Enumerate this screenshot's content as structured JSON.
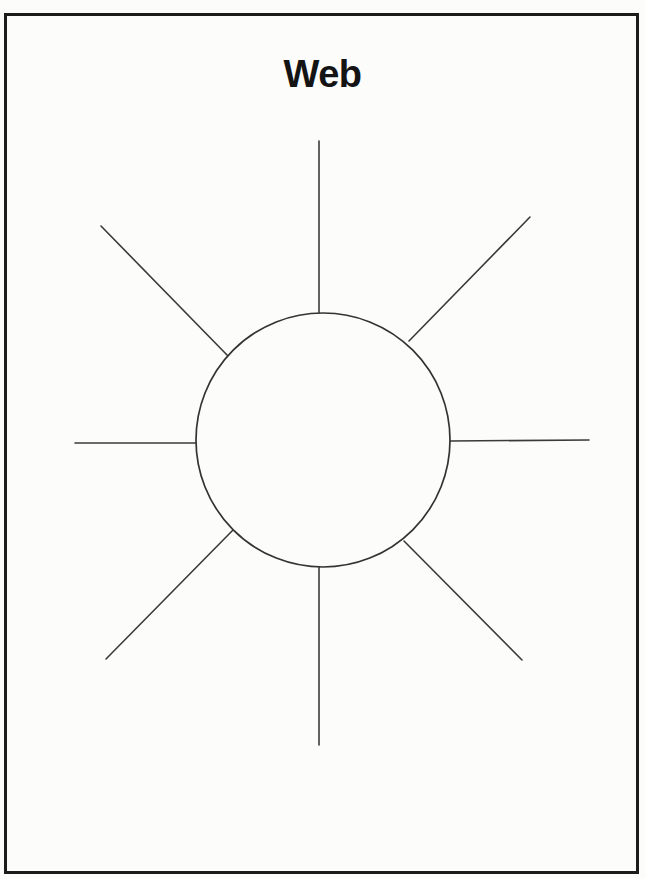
{
  "page": {
    "title": "Web",
    "background_color": "#fcfcfa",
    "border_color": "#1c1c1c"
  },
  "diagram": {
    "type": "web-graphic-organizer",
    "center_label": "",
    "spoke_count": 8,
    "line_color": "#3a3a3a",
    "spoke_labels": [
      "",
      "",
      "",
      "",
      "",
      "",
      "",
      ""
    ]
  }
}
